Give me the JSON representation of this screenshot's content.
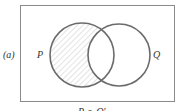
{
  "diagram": {
    "part_label": "(a)",
    "universe_box": true,
    "sets": [
      {
        "name": "P",
        "cx": 82,
        "cy": 55,
        "r": 32,
        "shaded": "only-P"
      },
      {
        "name": "Q",
        "cx": 119,
        "cy": 55,
        "r": 31
      }
    ],
    "caption": "P ∩ Q'",
    "colors": {
      "stroke": "#6b6b6b",
      "box": "#8a8a8a",
      "hatch": "#c8c8c8"
    }
  }
}
